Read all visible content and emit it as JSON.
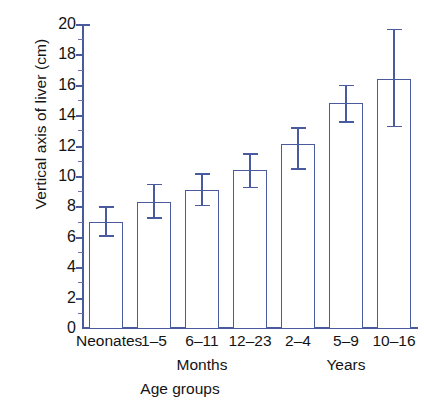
{
  "chart_data": {
    "type": "bar",
    "title": "",
    "subtitle": "",
    "xlabel": "Age groups",
    "ylabel": "Vertical axis of liver (cm)",
    "categories": [
      "Neonates",
      "1–5",
      "6–11",
      "12–23",
      "2–4",
      "5–9",
      "10–16"
    ],
    "values": [
      7.0,
      8.3,
      9.1,
      10.4,
      12.1,
      14.8,
      16.4
    ],
    "error_upper": [
      8.0,
      9.5,
      10.2,
      11.5,
      13.2,
      16.0,
      19.7
    ],
    "error_lower": [
      6.1,
      7.3,
      8.1,
      9.3,
      10.5,
      13.6,
      13.3
    ],
    "ylim": [
      0,
      20
    ],
    "yticks": [
      0,
      2,
      4,
      6,
      8,
      10,
      12,
      14,
      16,
      18,
      20
    ],
    "ytick_labels": [
      "0",
      "2",
      "4",
      "6",
      "8",
      "10",
      "12",
      "14",
      "16",
      "18",
      "20"
    ],
    "grid": false,
    "legend": null,
    "group_labels": [
      {
        "label": "Months",
        "spans": [
          "1–5",
          "6–11",
          "12–23"
        ]
      },
      {
        "label": "Years",
        "spans": [
          "2–4",
          "5–9",
          "10–16"
        ]
      }
    ],
    "colors": {
      "bar_stroke": "#4a5a9e",
      "bar_fill": "#ffffff",
      "axis": "#4a5a9e",
      "text": "#141414"
    }
  }
}
